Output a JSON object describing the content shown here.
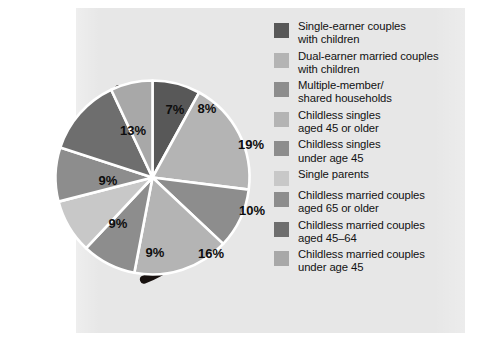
{
  "figure": {
    "panel_background": "#e7e7e7",
    "page_background": "#ffffff",
    "label_text_color": "#0d0d0d",
    "legend_text_color": "#121212",
    "separator_color": "#ffffff",
    "shadow_color": "#17110f"
  },
  "chart_data": {
    "type": "pie",
    "title": "",
    "subtitle": "",
    "xlabel": "",
    "ylabel": "",
    "grid": false,
    "legend_position": "right",
    "start_angle_deg": 0,
    "direction": "clockwise",
    "units": "percent",
    "total": 100,
    "categories": [
      "Single-earner couples with children",
      "Dual-earner married couples with children",
      "Multiple-member/shared households",
      "Childless singles aged 45 or older",
      "Childless singles under age 45",
      "Single parents",
      "Childless married couples aged 65 or older",
      "Childless married couples aged 45–64",
      "Childless married couples under age 45"
    ],
    "values": [
      8,
      19,
      10,
      16,
      9,
      9,
      9,
      13,
      7
    ],
    "value_labels": [
      "8%",
      "19%",
      "10%",
      "16%",
      "9%",
      "9%",
      "9%",
      "13%",
      "7%"
    ],
    "colors": [
      "#585858",
      "#b4b4b4",
      "#8d8d8d",
      "#b4b4b4",
      "#8d8d8d",
      "#c8c8c8",
      "#8d8d8d",
      "#6e6e6e",
      "#a8a8a8"
    ]
  },
  "slices": [
    {
      "label": "8%",
      "value": 8,
      "color": "#585858",
      "lx": 162,
      "ly": 40
    },
    {
      "label": "19%",
      "value": 19,
      "color": "#b4b4b4",
      "lx": 206,
      "ly": 76
    },
    {
      "label": "10%",
      "value": 10,
      "color": "#8d8d8d",
      "lx": 207,
      "ly": 142
    },
    {
      "label": "16%",
      "value": 16,
      "color": "#b4b4b4",
      "lx": 166,
      "ly": 185
    },
    {
      "label": "9%",
      "value": 9,
      "color": "#8d8d8d",
      "lx": 110,
      "ly": 184
    },
    {
      "label": "9%",
      "value": 9,
      "color": "#c8c8c8",
      "lx": 73,
      "ly": 155
    },
    {
      "label": "9%",
      "value": 9,
      "color": "#8d8d8d",
      "lx": 63,
      "ly": 112
    },
    {
      "label": "13%",
      "value": 13,
      "color": "#6e6e6e",
      "lx": 88,
      "ly": 62
    },
    {
      "label": "7%",
      "value": 7,
      "color": "#a8a8a8",
      "lx": 130,
      "ly": 41
    }
  ],
  "legend": {
    "items": [
      {
        "swatch": "#585858",
        "label": "Single-earner couples\nwith children"
      },
      {
        "swatch": "#b4b4b4",
        "label": "Dual-earner married couples\nwith children"
      },
      {
        "swatch": "#8d8d8d",
        "label": "Multiple-member/\nshared households"
      },
      {
        "swatch": "#b4b4b4",
        "label": "Childless singles\naged 45 or older"
      },
      {
        "swatch": "#8d8d8d",
        "label": "Childless singles\nunder age 45"
      },
      {
        "swatch": "#c8c8c8",
        "label": "Single parents"
      },
      {
        "swatch": "#8d8d8d",
        "label": "Childless married couples\naged 65 or older"
      },
      {
        "swatch": "#6e6e6e",
        "label": "Childless married couples\naged 45–64"
      },
      {
        "swatch": "#a8a8a8",
        "label": "Childless married couples\nunder age 45"
      }
    ]
  }
}
